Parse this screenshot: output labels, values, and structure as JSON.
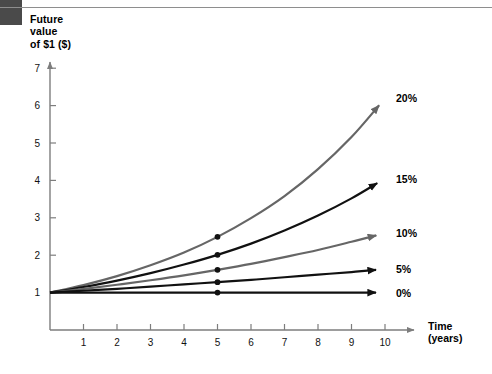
{
  "chart_data": {
    "type": "line",
    "title": "Future value of $1 ($)",
    "xlabel": "Time (years)",
    "ylabel": "Future value of $1 ($)",
    "xlim": [
      0,
      10.5
    ],
    "ylim": [
      0,
      7.6
    ],
    "xticks": [
      "1",
      "2",
      "3",
      "4",
      "5",
      "6",
      "7",
      "8",
      "9",
      "10"
    ],
    "yticks": [
      "1",
      "2",
      "3",
      "4",
      "5",
      "6",
      "7"
    ],
    "grid": false,
    "legend_position": "right-of-line-ends",
    "marker_x": 5,
    "x": [
      0,
      1,
      2,
      3,
      4,
      5,
      6,
      7,
      8,
      9,
      10
    ],
    "series": [
      {
        "name": "20%",
        "label": "20%",
        "color": "#666666",
        "rate": 0.2,
        "values": [
          1.0,
          1.2,
          1.44,
          1.73,
          2.07,
          2.49,
          2.99,
          3.58,
          4.3,
          5.16,
          6.19
        ],
        "marker_value": 2.49,
        "end_value": 6.19
      },
      {
        "name": "15%",
        "label": "15%",
        "color": "#111111",
        "rate": 0.15,
        "values": [
          1.0,
          1.15,
          1.32,
          1.52,
          1.75,
          2.01,
          2.31,
          2.66,
          3.06,
          3.52,
          4.05
        ],
        "marker_value": 2.01,
        "end_value": 4.05
      },
      {
        "name": "10%",
        "label": "10%",
        "color": "#666666",
        "rate": 0.1,
        "values": [
          1.0,
          1.1,
          1.21,
          1.33,
          1.46,
          1.61,
          1.77,
          1.95,
          2.14,
          2.36,
          2.59
        ],
        "marker_value": 1.61,
        "end_value": 2.59
      },
      {
        "name": "5%",
        "label": "5%",
        "color": "#111111",
        "rate": 0.05,
        "values": [
          1.0,
          1.05,
          1.1,
          1.16,
          1.22,
          1.28,
          1.34,
          1.41,
          1.48,
          1.55,
          1.63
        ],
        "marker_value": 1.28,
        "end_value": 1.63
      },
      {
        "name": "0%",
        "label": "0%",
        "color": "#111111",
        "rate": 0.0,
        "values": [
          1.0,
          1.0,
          1.0,
          1.0,
          1.0,
          1.0,
          1.0,
          1.0,
          1.0,
          1.0,
          1.0
        ],
        "marker_value": 1.0,
        "end_value": 1.0
      }
    ]
  },
  "header": {
    "title_line1": "Future",
    "title_line2": "value",
    "title_line3": "of $1 ($)",
    "title_full": "Future\nvalue\nof $1 ($)"
  },
  "axes": {
    "x_title_line1": "Time",
    "x_title_line2": "(years)",
    "x_title_full": "Time\n(years)"
  },
  "colors": {
    "corner_block": "#4a4a4a",
    "rule": "#8e8e8e",
    "axis": "#7d7d7d",
    "gray_series": "#666666",
    "black_series": "#111111",
    "background": "#ffffff"
  }
}
